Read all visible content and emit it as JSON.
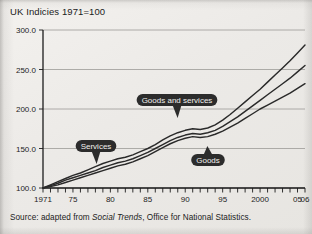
{
  "chart_title": "UK Indicies 1971=100",
  "source_prefix": "Source: adapted from ",
  "source_italic": "Social Trends",
  "source_suffix": ", Office for National Statistics.",
  "colors": {
    "paper": "#edebe8",
    "ink": "#2a2a2a",
    "grid": "#9c9a97",
    "pill": "#2c2c2c",
    "pill_text": "#f2f1ef"
  },
  "annotations": [
    {
      "label": "Services",
      "pointer": "down",
      "x": 96,
      "y": 146
    },
    {
      "label": "Goods and services",
      "pointer": "down",
      "x": 177,
      "y": 100
    },
    {
      "label": "Goods",
      "pointer": "up",
      "x": 208,
      "y": 160
    }
  ],
  "chart_data": {
    "type": "line",
    "title": "UK Indicies 1971=100",
    "xlabel": "",
    "ylabel": "",
    "ylim": [
      100.0,
      300.0
    ],
    "yticks": [
      100.0,
      150.0,
      200.0,
      250.0,
      300.0
    ],
    "ytick_labels": [
      "100.0",
      "150.0",
      "200.0",
      "250.0",
      "300.0"
    ],
    "xlim": [
      1971,
      2006
    ],
    "xticks": [
      1971,
      1975,
      1980,
      1985,
      1990,
      1995,
      2000,
      2005,
      2006
    ],
    "xtick_labels": [
      "1971",
      "75",
      "80",
      "85",
      "90",
      "95",
      "2000",
      "05",
      "06"
    ],
    "minor_xticks_every": 1,
    "grid": true,
    "grid_axis": "y",
    "legend": "inline-annotations",
    "x": [
      1971,
      1972,
      1973,
      1974,
      1975,
      1976,
      1977,
      1978,
      1979,
      1980,
      1981,
      1982,
      1983,
      1984,
      1985,
      1986,
      1987,
      1988,
      1989,
      1990,
      1991,
      1992,
      1993,
      1994,
      1995,
      1996,
      1997,
      1998,
      1999,
      2000,
      2001,
      2002,
      2003,
      2004,
      2005,
      2006
    ],
    "series": [
      {
        "name": "Services",
        "values": [
          100,
          104,
          108,
          112,
          116,
          119,
          123,
          127,
          131,
          134,
          137,
          139,
          142,
          146,
          150,
          155,
          161,
          166,
          170,
          173,
          175,
          174,
          176,
          180,
          186,
          193,
          201,
          209,
          217,
          225,
          234,
          243,
          252,
          261,
          271,
          281
        ]
      },
      {
        "name": "Goods and services",
        "values": [
          100,
          103,
          106,
          110,
          113,
          116,
          119,
          122,
          126,
          129,
          132,
          134,
          137,
          141,
          145,
          150,
          155,
          160,
          164,
          167,
          169,
          168,
          170,
          173,
          178,
          184,
          190,
          197,
          204,
          211,
          218,
          225,
          232,
          239,
          247,
          255
        ]
      },
      {
        "name": "Goods",
        "values": [
          100,
          102,
          104,
          107,
          110,
          113,
          116,
          119,
          122,
          125,
          128,
          130,
          133,
          137,
          141,
          146,
          151,
          156,
          160,
          163,
          165,
          164,
          165,
          168,
          172,
          177,
          182,
          188,
          194,
          200,
          205,
          210,
          215,
          220,
          226,
          232
        ]
      }
    ]
  }
}
